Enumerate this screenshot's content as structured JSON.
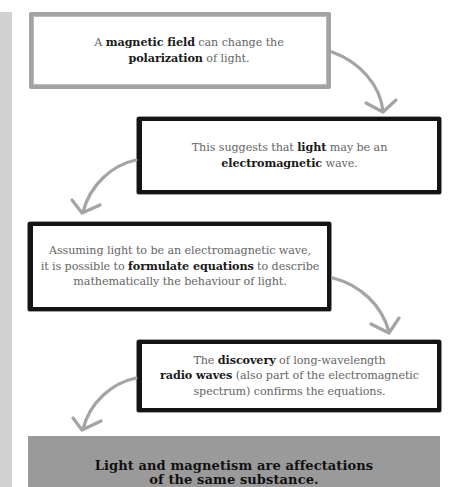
{
  "steps": [
    {
      "id": "box1",
      "style": "gray-border",
      "lines": [
        [
          {
            "t": "A ",
            "b": false
          },
          {
            "t": "magnetic field",
            "b": true
          },
          {
            "t": " can change the",
            "b": false
          }
        ],
        [
          {
            "t": "polarization",
            "b": true
          },
          {
            "t": " of light.",
            "b": false
          }
        ]
      ]
    },
    {
      "id": "box2",
      "style": "black-border",
      "lines": [
        [
          {
            "t": "This suggests that ",
            "b": false
          },
          {
            "t": "light",
            "b": true
          },
          {
            "t": " may be an",
            "b": false
          }
        ],
        [
          {
            "t": "electromagnetic",
            "b": true
          },
          {
            "t": " wave.",
            "b": false
          }
        ]
      ]
    },
    {
      "id": "box3",
      "style": "black-border",
      "lines": [
        [
          {
            "t": "Assuming light to be an electromagnetic wave,",
            "b": false
          }
        ],
        [
          {
            "t": "it is possible to ",
            "b": false
          },
          {
            "t": "formulate equations",
            "b": true
          },
          {
            "t": " to describe",
            "b": false
          }
        ],
        [
          {
            "t": "mathematically the behaviour of light.",
            "b": false
          }
        ]
      ]
    },
    {
      "id": "box4",
      "style": "black-border",
      "lines": [
        [
          {
            "t": "The ",
            "b": false
          },
          {
            "t": "discovery",
            "b": true
          },
          {
            "t": " of long-wavelength",
            "b": false
          }
        ],
        [
          {
            "t": "radio waves",
            "b": true
          },
          {
            "t": " (also part of the electromagnetic",
            "b": false
          }
        ],
        [
          {
            "t": "spectrum) confirms the equations.",
            "b": false
          }
        ]
      ]
    }
  ],
  "conclusion": {
    "line1": "Light and magnetism are affectations",
    "line2": "of the same substance."
  },
  "arrows": [
    {
      "name": "arrow-box1-to-box2",
      "icon": "curved-arrow-down-right-icon"
    },
    {
      "name": "arrow-box2-to-box3",
      "icon": "curved-arrow-down-left-icon"
    },
    {
      "name": "arrow-box3-to-box4",
      "icon": "curved-arrow-down-right-icon"
    },
    {
      "name": "arrow-box4-to-conclusion",
      "icon": "curved-arrow-down-left-icon"
    }
  ],
  "colors": {
    "page_bg": "#ffffff",
    "side_strip": "#d2d2d2",
    "gray_border": "#a3a3a3",
    "black_border": "#141414",
    "arrow": "#a4a4a4",
    "conclusion_bg": "#9a9a9a",
    "body_text": "#666666",
    "bold_text": "#1a1a1a"
  }
}
